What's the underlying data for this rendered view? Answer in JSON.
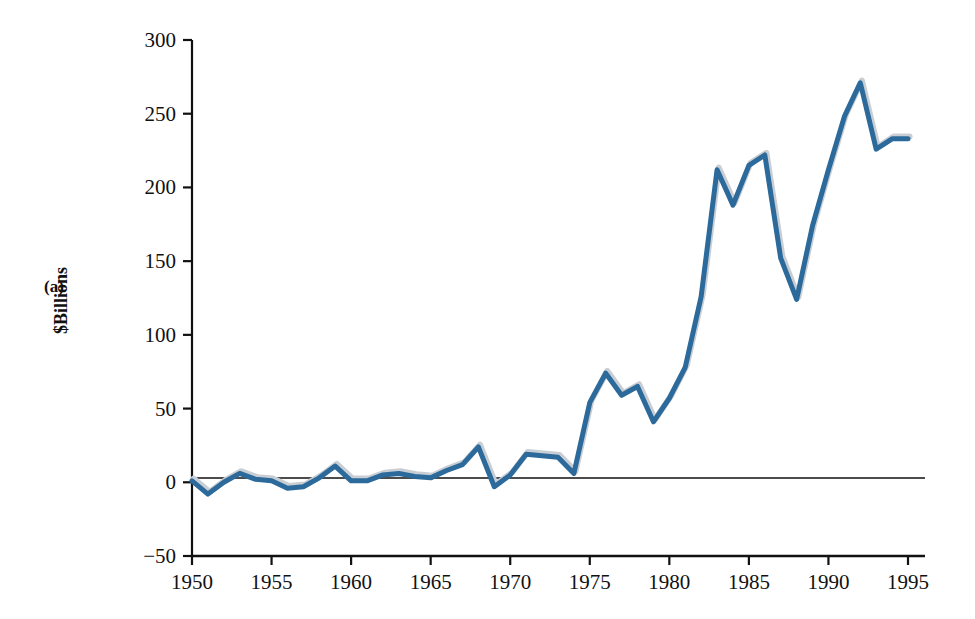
{
  "figure": {
    "panel_label": "(a)",
    "title": "",
    "background_color": "#ffffff"
  },
  "axes": {
    "y_axis_title": "$Billions",
    "y_ticks": [
      "-50",
      "0",
      "50",
      "100",
      "150",
      "200",
      "250",
      "300"
    ],
    "x_ticks": [
      "1950",
      "1955",
      "1960",
      "1965",
      "1970",
      "1975",
      "1980",
      "1985",
      "1990",
      "1995"
    ],
    "axis_color": "#111111"
  },
  "style": {
    "line_color": "#2B6A9B",
    "shadow_color": "#C9CED4",
    "line_width": 5
  },
  "chart_data": {
    "type": "line",
    "title": "",
    "xlabel": "",
    "ylabel": "$Billions",
    "xlim": [
      1950,
      1995
    ],
    "ylim": [
      -50,
      300
    ],
    "grid": false,
    "legend": "none",
    "x_tick_values": [
      1950,
      1955,
      1960,
      1965,
      1970,
      1975,
      1980,
      1985,
      1990,
      1995
    ],
    "y_tick_values": [
      -50,
      0,
      50,
      100,
      150,
      200,
      250,
      300
    ],
    "x": [
      1950,
      1951,
      1952,
      1953,
      1954,
      1955,
      1956,
      1957,
      1958,
      1959,
      1960,
      1961,
      1962,
      1963,
      1964,
      1965,
      1966,
      1967,
      1968,
      1969,
      1970,
      1971,
      1972,
      1973,
      1974,
      1975,
      1976,
      1977,
      1978,
      1979,
      1980,
      1981,
      1982,
      1983,
      1984,
      1985,
      1986,
      1987,
      1988,
      1989,
      1990,
      1991,
      1992,
      1993,
      1994,
      1995
    ],
    "series": [
      {
        "name": "Value",
        "values": [
          1,
          -8,
          0,
          6,
          2,
          1,
          -4,
          -3,
          3,
          11,
          1,
          1,
          5,
          6,
          4,
          3,
          8,
          12,
          24,
          -3,
          5,
          19,
          18,
          17,
          6,
          54,
          74,
          59,
          65,
          41,
          57,
          78,
          126,
          212,
          188,
          215,
          222,
          152,
          124,
          174,
          212,
          248,
          271,
          226,
          233,
          233
        ]
      }
    ]
  }
}
